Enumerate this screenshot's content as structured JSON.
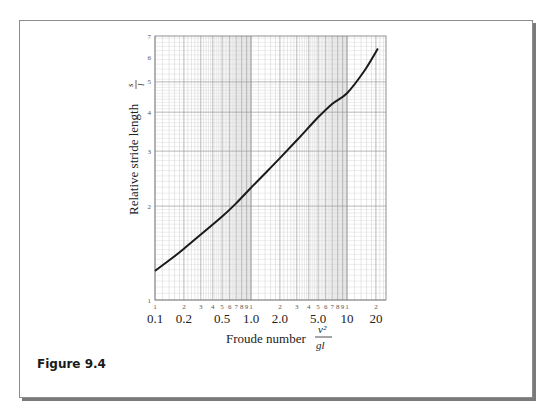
{
  "figure": {
    "label": "Figure 9.4",
    "border_color": "#8c8c8c",
    "shadow_color": "#7a7a7a"
  },
  "chart_data": {
    "type": "line",
    "title": "",
    "xscale": "log",
    "yscale": "log",
    "xlabel": "Froude number",
    "xlabel_fraction": {
      "numerator": "v²",
      "denominator": "gl"
    },
    "ylabel": "Relative stride length",
    "ylabel_fraction": {
      "numerator": "s",
      "denominator": "l"
    },
    "xlim": [
      0.1,
      25
    ],
    "ylim": [
      1,
      7
    ],
    "grid": true,
    "x_minor_tick_labels": [
      "1",
      "2",
      "3",
      "4",
      "5",
      "6",
      "7",
      "8",
      "9",
      "1",
      "2",
      "3",
      "4",
      "5",
      "6",
      "7",
      "8",
      "9",
      "1",
      "2"
    ],
    "x_major_tick_labels": [
      {
        "label": "0.1",
        "value": 0.1
      },
      {
        "label": "0.2",
        "value": 0.2
      },
      {
        "label": "0.5",
        "value": 0.5
      },
      {
        "label": "1.0",
        "value": 1.0
      },
      {
        "label": "2.0",
        "value": 2.0
      },
      {
        "label": "5.0",
        "value": 5.0
      },
      {
        "label": "10",
        "value": 10
      },
      {
        "label": "20",
        "value": 20
      }
    ],
    "y_tick_labels": [
      {
        "label": "1",
        "value": 1
      },
      {
        "label": "2",
        "value": 2
      },
      {
        "label": "3",
        "value": 3
      },
      {
        "label": "4",
        "value": 4
      },
      {
        "label": "5",
        "value": 5
      },
      {
        "label": "6",
        "value": 6
      },
      {
        "label": "7",
        "value": 7
      }
    ],
    "series": [
      {
        "name": "Relative stride length vs Froude number",
        "color": "#1a1a1a",
        "x": [
          0.1,
          0.15,
          0.2,
          0.3,
          0.5,
          0.7,
          1.0,
          1.5,
          2.0,
          3.0,
          5.0,
          7.0,
          10,
          15,
          21
        ],
        "y": [
          1.24,
          1.36,
          1.46,
          1.62,
          1.85,
          2.04,
          2.29,
          2.6,
          2.85,
          3.25,
          3.85,
          4.25,
          4.6,
          5.4,
          6.4
        ]
      }
    ]
  }
}
